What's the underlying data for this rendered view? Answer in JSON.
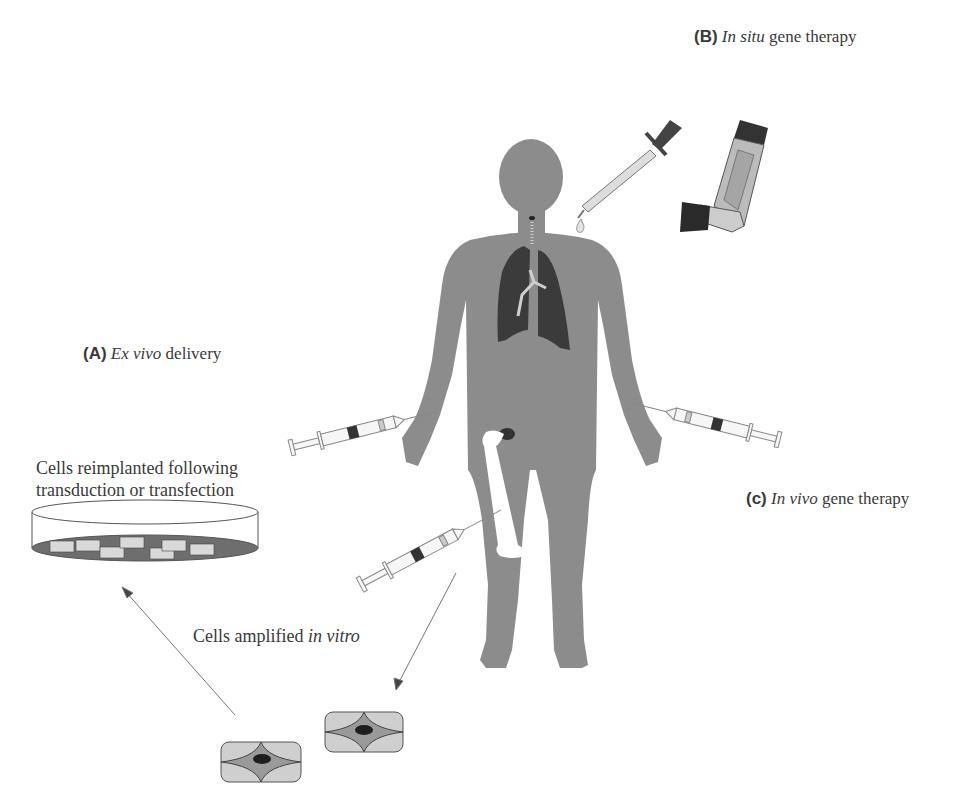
{
  "labels": {
    "b": {
      "letter": "(B)",
      "italic": "In situ",
      "rest": " gene therapy"
    },
    "a": {
      "letter": "(A)",
      "italic": "Ex vivo",
      "rest": " delivery"
    },
    "c": {
      "letter": "(c)",
      "italic": "In vivo",
      "rest": " gene therapy"
    }
  },
  "captions": {
    "reimplanted_line1": "Cells reimplanted following",
    "reimplanted_line2": "transduction or transfection",
    "amplified_plain": "Cells amplified ",
    "amplified_italic": "in vitro"
  },
  "colors": {
    "body": "#8c8c8c",
    "lungs": "#3b3b3b",
    "bone": "#ffffff",
    "dish_fill": "#6e6e6e",
    "cell_outer": "#c8c8c8",
    "cell_inner": "#999999",
    "nucleus": "#222222",
    "arrow": "#555555"
  },
  "icons": [
    "human-body-icon",
    "lungs-icon",
    "femur-bone-icon",
    "dropper-icon",
    "inhaler-icon",
    "syringe-icon",
    "petri-dish-icon",
    "cell-icon"
  ]
}
